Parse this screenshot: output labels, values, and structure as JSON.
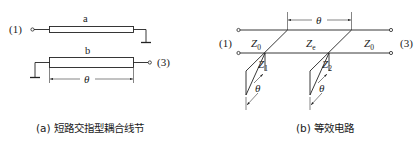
{
  "figure_a": {
    "port_in": "(1)",
    "port_out": "(3)",
    "line_a_label": "a",
    "line_b_label": "b",
    "length_label": "θ",
    "caption": "(a) 短路交指型耦合线节"
  },
  "figure_b": {
    "port_in": "(1)",
    "port_out": "(3)",
    "z_left": "Z",
    "z_left_sub": "0",
    "z_mid": "Z",
    "z_mid_sub": "e",
    "z_right": "Z",
    "z_right_sub": "0",
    "stub1": "Z",
    "stub1_sub": "1",
    "stub2": "Z",
    "stub2_sub": "2",
    "length_label_top": "θ",
    "length_label_stub1": "θ",
    "length_label_stub2": "θ",
    "caption": "(b) 等效电路"
  }
}
